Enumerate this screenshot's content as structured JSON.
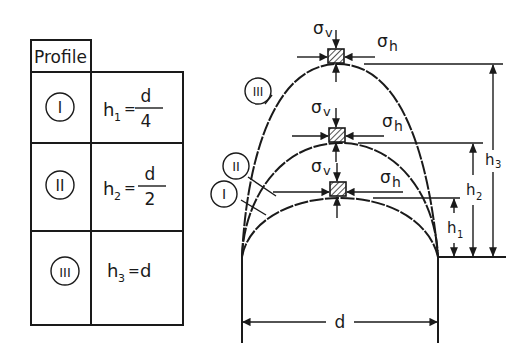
{
  "table": {
    "header": "Profile",
    "rows": [
      {
        "profile": "I",
        "formula_lhs": "h",
        "sub": "1",
        "eq": "=",
        "rhs_num": "d",
        "rhs_den": "4",
        "rhs": ""
      },
      {
        "profile": "II",
        "formula_lhs": "h",
        "sub": "2",
        "eq": "=",
        "rhs_num": "d",
        "rhs_den": "2",
        "rhs": ""
      },
      {
        "profile": "III",
        "formula_lhs": "h",
        "sub": "3",
        "eq": "=",
        "rhs_num": "",
        "rhs_den": "",
        "rhs": "d"
      }
    ]
  },
  "diagram": {
    "profiles": [
      "I",
      "II",
      "III"
    ],
    "stress_vertical": "σv",
    "stress_horizontal": "σh",
    "sigma": "σ",
    "v": "v",
    "h": "h",
    "height_labels": [
      {
        "h": "h",
        "sub": "1"
      },
      {
        "h": "h",
        "sub": "2"
      },
      {
        "h": "h",
        "sub": "3"
      }
    ],
    "width_label": "d"
  }
}
